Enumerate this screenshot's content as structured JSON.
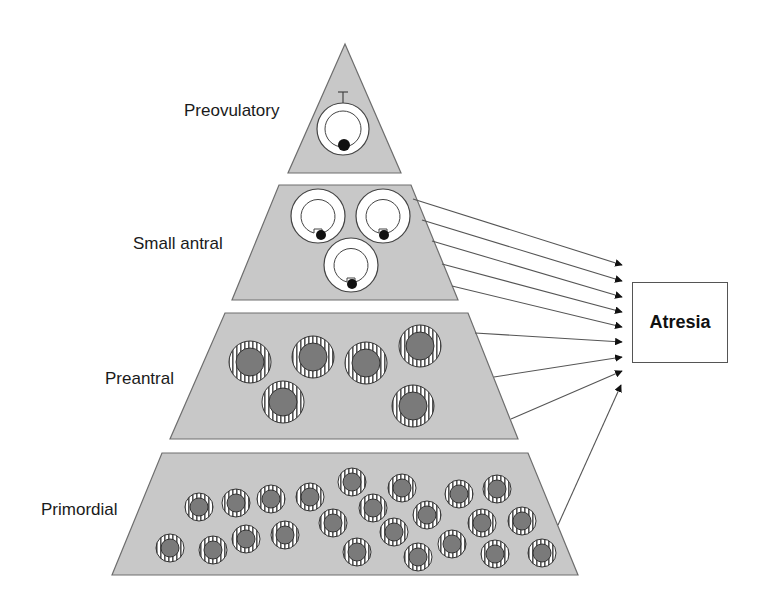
{
  "diagram": {
    "type": "pyramid-with-arrows",
    "tiers": [
      {
        "id": "preovulatory",
        "label": "Preovulatory",
        "follicle_count": 1
      },
      {
        "id": "small-antral",
        "label": "Small antral",
        "follicle_count": 3
      },
      {
        "id": "preantral",
        "label": "Preantral",
        "follicle_count": 6
      },
      {
        "id": "primordial",
        "label": "Primordial",
        "follicle_count": 26
      }
    ],
    "target": {
      "label": "Atresia"
    },
    "arrows": [
      {
        "from": "small-antral",
        "count": 5
      },
      {
        "from": "preantral",
        "count": 3
      },
      {
        "from": "primordial",
        "count": 1
      }
    ],
    "colors": {
      "tier_fill": "#c8c8c8",
      "tier_stroke": "#6e6e6e",
      "follicle_core": "#7a7a7a",
      "arrow": "#555555",
      "text": "#1a1a1a"
    }
  }
}
